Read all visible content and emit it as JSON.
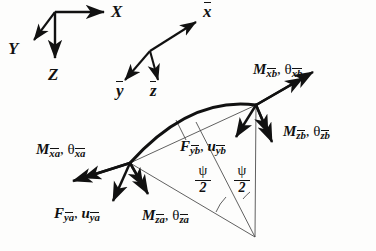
{
  "figure": {
    "background_color": "#fdfdfc",
    "ink_color": "#111111"
  },
  "global_axes": {
    "name": "global-coordinate-triad",
    "origin": [
      55,
      12
    ],
    "labels": {
      "x": "X",
      "y": "Y",
      "z": "Z"
    }
  },
  "local_axes": {
    "name": "local-barred-coordinate-triad",
    "origin": [
      150,
      51
    ],
    "labels": {
      "x": "x",
      "y": "y",
      "z": "z"
    }
  },
  "nodes": {
    "a": {
      "label": "node-a",
      "x": 130,
      "y": 163
    },
    "b": {
      "label": "node-b",
      "x": 256,
      "y": 105
    },
    "apex": {
      "label": "center-of-curvature",
      "x": 255,
      "y": 237
    }
  },
  "end_a": {
    "moment_x": {
      "symbol": "M",
      "sub": "xa",
      "theta": "θ",
      "theta_sub": "xa"
    },
    "force_y": {
      "symbol": "F",
      "sub": "ya",
      "disp": "u",
      "disp_sub": "ya"
    },
    "moment_z": {
      "symbol": "M",
      "sub": "za",
      "theta": "θ",
      "theta_sub": "za"
    }
  },
  "end_b": {
    "moment_x": {
      "symbol": "M",
      "sub": "xb",
      "theta": "θ",
      "theta_sub": "xb"
    },
    "force_y": {
      "symbol": "F",
      "sub": "yb",
      "disp": "u",
      "disp_sub": "yb"
    },
    "moment_z": {
      "symbol": "M",
      "sub": "zb",
      "theta": "θ",
      "theta_sub": "zb"
    }
  },
  "angles": {
    "half_subtended_left": {
      "numerator": "ψ",
      "denominator": "2"
    },
    "half_subtended_right": {
      "numerator": "ψ",
      "denominator": "2"
    }
  },
  "separators": {
    "comma": ","
  }
}
